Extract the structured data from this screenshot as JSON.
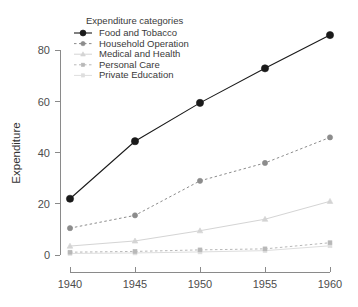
{
  "chart_data": {
    "type": "line",
    "title": "",
    "subtitle": "",
    "xlabel": "",
    "ylabel": "Expenditure",
    "x": [
      1940,
      1945,
      1950,
      1955,
      1960
    ],
    "xtick_labels": [
      "1940",
      "1945",
      "1950",
      "1955",
      "1960"
    ],
    "ytick_labels": [
      "0",
      "20",
      "40",
      "60",
      "80"
    ],
    "yticks": [
      0,
      20,
      40,
      60,
      80
    ],
    "xlim": [
      1940,
      1960
    ],
    "ylim": [
      0,
      88
    ],
    "grid": false,
    "legend_position": "top-left-inside",
    "legend_title": "Expenditure categories",
    "series": [
      {
        "name": "Food and Tobacco",
        "values": [
          22.0,
          44.5,
          59.5,
          73.0,
          86.0
        ],
        "color": "#1a1a1a",
        "marker": "circle",
        "linestyle": "solid"
      },
      {
        "name": "Household Operation",
        "values": [
          10.5,
          15.5,
          29.0,
          36.0,
          46.0
        ],
        "color": "#8c8c8c",
        "marker": "circle",
        "linestyle": "dashed"
      },
      {
        "name": "Medical and Health",
        "values": [
          3.5,
          5.5,
          9.5,
          14.0,
          21.0
        ],
        "color": "#d4d4d4",
        "marker": "triangle",
        "linestyle": "solid"
      },
      {
        "name": "Personal Care",
        "values": [
          1.1,
          1.4,
          2.0,
          2.4,
          4.8
        ],
        "color": "#b8b8b8",
        "marker": "square",
        "linestyle": "dashed"
      },
      {
        "name": "Private Education",
        "values": [
          0.6,
          0.8,
          1.2,
          1.7,
          3.6
        ],
        "color": "#dedede",
        "marker": "square",
        "linestyle": "solid"
      }
    ]
  },
  "legend": {
    "title": "Expenditure categories",
    "items": [
      {
        "label": "Food and Tobacco"
      },
      {
        "label": "Household Operation"
      },
      {
        "label": "Medical and Health"
      },
      {
        "label": "Personal Care"
      },
      {
        "label": "Private Education"
      }
    ]
  },
  "axes": {
    "y_title": "Expenditure",
    "x_tick_labels": [
      "1940",
      "1945",
      "1950",
      "1955",
      "1960"
    ],
    "y_tick_labels": [
      "0",
      "20",
      "40",
      "60",
      "80"
    ]
  }
}
